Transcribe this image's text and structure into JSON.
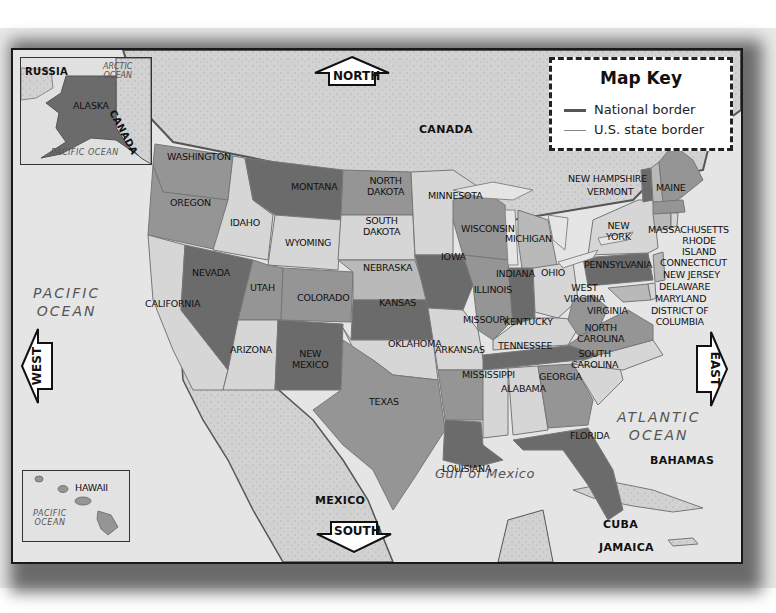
{
  "map": {
    "map_key": {
      "title": "Map Key",
      "items": [
        {
          "label": "National border",
          "line_color": "#555555",
          "line_width": 3
        },
        {
          "label": "U.S. state border",
          "line_color": "#888888",
          "line_width": 1
        }
      ]
    },
    "compass": {
      "north": "NORTH",
      "south": "SOUTH",
      "east": "EAST",
      "west": "WEST"
    },
    "alaska_inset": {
      "labels": {
        "russia": "RUSSIA",
        "arctic": "ARCTIC\nOCEAN",
        "alaska": "ALASKA",
        "canada": "CANADA",
        "pacific": "PACIFIC OCEAN"
      }
    },
    "hawaii_inset": {
      "labels": {
        "hawaii": "HAWAII",
        "pacific": "PACIFIC\nOCEAN"
      }
    },
    "countries": {
      "canada": "CANADA",
      "mexico": "MEXICO",
      "cuba": "CUBA",
      "bahamas": "BAHAMAS",
      "jamaica": "JAMAICA"
    },
    "water": {
      "pacific": "PACIFIC\nOCEAN",
      "atlantic": "ATLANTIC\nOCEAN",
      "gulf": "Gulf of Mexico"
    },
    "states": {
      "washington": "WASHINGTON",
      "oregon": "OREGON",
      "california": "CALIFORNIA",
      "idaho": "IDAHO",
      "nevada": "NEVADA",
      "montana": "MONTANA",
      "wyoming": "WYOMING",
      "utah": "UTAH",
      "arizona": "ARIZONA",
      "colorado": "COLORADO",
      "new_mexico": "NEW\nMEXICO",
      "north_dakota": "NORTH\nDAKOTA",
      "south_dakota": "SOUTH\nDAKOTA",
      "nebraska": "NEBRASKA",
      "kansas": "KANSAS",
      "oklahoma": "OKLAHOMA",
      "texas": "TEXAS",
      "minnesota": "MINNESOTA",
      "iowa": "IOWA",
      "missouri": "MISSOURI",
      "arkansas": "ARKANSAS",
      "louisiana": "LOUISIANA",
      "wisconsin": "WISCONSIN",
      "illinois": "ILLINOIS",
      "michigan": "MICHIGAN",
      "indiana": "INDIANA",
      "ohio": "OHIO",
      "kentucky": "KENTUCKY",
      "tennessee": "TENNESSEE",
      "mississippi": "MISSISSIPPI",
      "alabama": "ALABAMA",
      "georgia": "GEORGIA",
      "florida": "FLORIDA",
      "south_carolina": "SOUTH\nCAROLINA",
      "north_carolina": "NORTH\nCAROLINA",
      "virginia": "VIRGINIA",
      "west_virginia": "WEST\nVIRGINIA",
      "pennsylvania": "PENNSYLVANIA",
      "new_york": "NEW\nYORK",
      "vermont": "VERMONT",
      "new_hampshire": "NEW HAMPSHIRE",
      "maine": "MAINE",
      "massachusetts": "MASSACHUSETTS",
      "rhode_island": "RHODE\nISLAND",
      "connecticut": "CONNECTICUT",
      "new_jersey": "NEW JERSEY",
      "delaware": "DELAWARE",
      "maryland": "MARYLAND",
      "dc": "DISTRICT OF\nCOLUMBIA"
    },
    "colors": {
      "shade_dark": "#6b6b6b",
      "shade_mid": "#959595",
      "shade_light": "#b9b9b9",
      "shade_pale": "#d6d6d6",
      "water": "#e6e6e6",
      "foreign_land": "#d0d0d0",
      "frame": "#1a1a1a"
    }
  }
}
